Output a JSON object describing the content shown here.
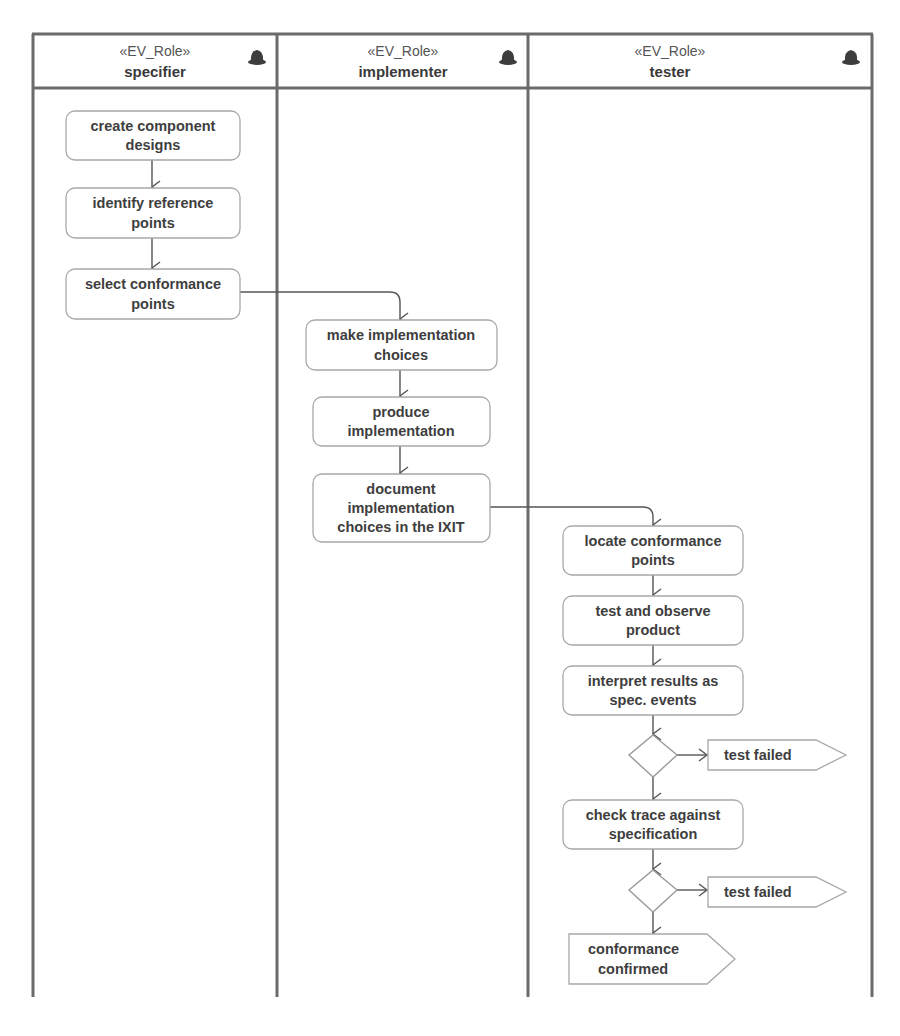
{
  "lanes": [
    {
      "stereotype": "«EV_Role»",
      "name": "specifier",
      "icon": "role-hat-icon"
    },
    {
      "stereotype": "«EV_Role»",
      "name": "implementer",
      "icon": "role-hat-icon"
    },
    {
      "stereotype": "«EV_Role»",
      "name": "tester",
      "icon": "role-hat-icon"
    }
  ],
  "actions": {
    "specifier": [
      {
        "lines": [
          "create component",
          "designs"
        ]
      },
      {
        "lines": [
          "identify reference",
          "points"
        ]
      },
      {
        "lines": [
          "select conformance",
          "points"
        ]
      }
    ],
    "implementer": [
      {
        "lines": [
          "make implementation",
          "choices"
        ]
      },
      {
        "lines": [
          "produce",
          "implementation"
        ]
      },
      {
        "lines": [
          "document",
          "implementation",
          "choices in the IXIT"
        ]
      }
    ],
    "tester": [
      {
        "lines": [
          "locate conformance",
          "points"
        ]
      },
      {
        "lines": [
          "test and observe",
          "product"
        ]
      },
      {
        "lines": [
          "interpret results as",
          "spec. events"
        ]
      },
      {
        "lines": [
          "check trace against",
          "specification"
        ]
      }
    ]
  },
  "signals": [
    {
      "lines": [
        "test failed"
      ]
    },
    {
      "lines": [
        "test failed"
      ]
    },
    {
      "lines": [
        "conformance",
        "confirmed"
      ]
    }
  ],
  "decisions": [
    {
      "name": "decision-after-interpret"
    },
    {
      "name": "decision-after-check-trace"
    }
  ],
  "colors": {
    "frame": "#6b6b6b",
    "action_border": "#a8a8a8",
    "flow": "#555555",
    "text": "#3e3e3e"
  }
}
